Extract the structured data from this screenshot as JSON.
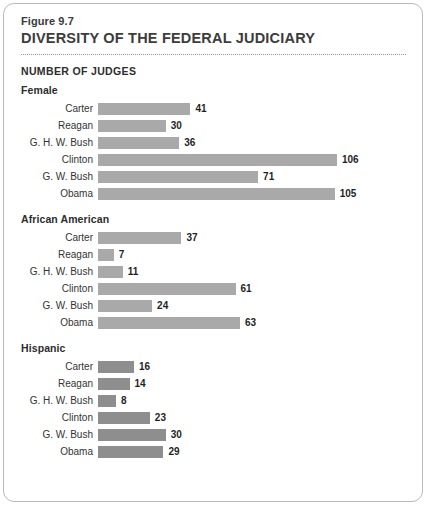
{
  "figure": {
    "label": "Figure 9.7",
    "title": "DIVERSITY OF THE FEDERAL JUDICIARY"
  },
  "chart_data": {
    "type": "bar",
    "orientation": "horizontal",
    "title": "NUMBER OF JUDGES",
    "xlabel": "",
    "ylabel": "",
    "xlim": [
      0,
      106
    ],
    "grid": false,
    "legend": "none",
    "categories": [
      "Carter",
      "Reagan",
      "G. H. W. Bush",
      "Clinton",
      "G. W. Bush",
      "Obama"
    ],
    "groups": [
      {
        "name": "Female",
        "color": "#a9a9a9",
        "values": [
          41,
          30,
          36,
          106,
          71,
          105
        ]
      },
      {
        "name": "African American",
        "color": "#a9a9a9",
        "values": [
          37,
          7,
          11,
          61,
          24,
          63
        ]
      },
      {
        "name": "Hispanic",
        "color": "#8e8e8e",
        "values": [
          16,
          14,
          8,
          23,
          30,
          29
        ]
      }
    ]
  }
}
